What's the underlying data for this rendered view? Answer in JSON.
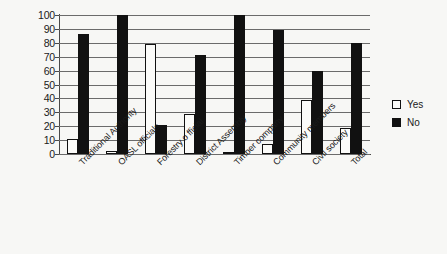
{
  "chart_data": {
    "type": "bar",
    "title": "",
    "subtitle": "",
    "xlabel": "",
    "ylabel": "",
    "ylim": [
      0,
      100
    ],
    "ytick_step": 10,
    "yticks": [
      "100",
      "90",
      "80",
      "70",
      "60",
      "50",
      "40",
      "30",
      "20",
      "10",
      "0"
    ],
    "grid": true,
    "legend_position": "right",
    "categories": [
      "Traditional Authority",
      "OASL officials",
      "Forestry o fficial",
      "District Assembly",
      "Timber company",
      "Community members",
      "Civil society",
      "Total"
    ],
    "series": [
      {
        "name": "Yes",
        "color": "#ffffff",
        "values": [
          11,
          2,
          79,
          29,
          1,
          7,
          39,
          19
        ]
      },
      {
        "name": "No",
        "color": "#111111",
        "values": [
          86,
          100,
          21,
          71,
          100,
          89,
          60,
          80
        ]
      }
    ]
  },
  "legend": {
    "items": [
      {
        "label": "Yes",
        "style": "yes"
      },
      {
        "label": "No",
        "style": "no"
      }
    ]
  }
}
